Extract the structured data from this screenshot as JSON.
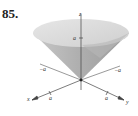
{
  "figure": {
    "number": "85.",
    "axes": {
      "z_label": "z",
      "x_label": "x",
      "y_label": "y",
      "ticks": {
        "z_pos": "a",
        "x_neg": "−a",
        "x_pos": "a",
        "y_neg": "−a",
        "y_pos": "a"
      }
    },
    "colors": {
      "surface_light": "#d9d9d9",
      "surface_dark": "#a8a8a8",
      "axis": "#444444"
    }
  }
}
